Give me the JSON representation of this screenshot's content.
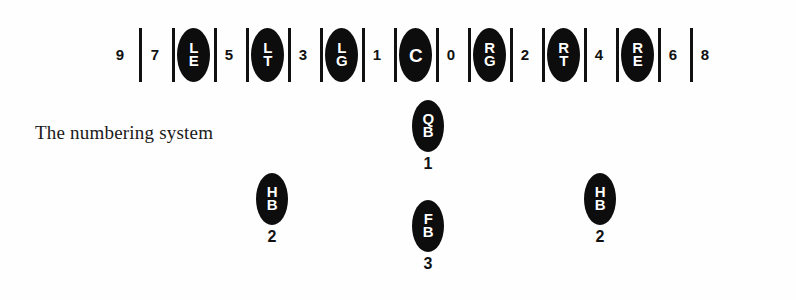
{
  "figure": {
    "caption": "The numbering system",
    "ink_color": "#0d0d0d",
    "paper_color": "#fefefe"
  },
  "line_of_scrimmage": {
    "slots": [
      {
        "kind": "number",
        "label": "9",
        "x": 120
      },
      {
        "kind": "bar",
        "x": 139
      },
      {
        "kind": "number",
        "label": "7",
        "x": 155
      },
      {
        "kind": "bar",
        "x": 172
      },
      {
        "kind": "oval",
        "label": "LE",
        "x": 177
      },
      {
        "kind": "bar",
        "x": 214
      },
      {
        "kind": "number",
        "label": "5",
        "x": 229
      },
      {
        "kind": "bar",
        "x": 246
      },
      {
        "kind": "oval",
        "label": "LT",
        "x": 251
      },
      {
        "kind": "bar",
        "x": 288
      },
      {
        "kind": "number",
        "label": "3",
        "x": 303
      },
      {
        "kind": "bar",
        "x": 320
      },
      {
        "kind": "oval",
        "label": "LG",
        "x": 325
      },
      {
        "kind": "bar",
        "x": 362
      },
      {
        "kind": "number",
        "label": "1",
        "x": 377
      },
      {
        "kind": "bar",
        "x": 394
      },
      {
        "kind": "oval",
        "label": "C",
        "x": 399
      },
      {
        "kind": "bar",
        "x": 436
      },
      {
        "kind": "number",
        "label": "0",
        "x": 451
      },
      {
        "kind": "bar",
        "x": 468
      },
      {
        "kind": "oval",
        "label": "RG",
        "x": 473
      },
      {
        "kind": "bar",
        "x": 510
      },
      {
        "kind": "number",
        "label": "2",
        "x": 525
      },
      {
        "kind": "bar",
        "x": 542
      },
      {
        "kind": "oval",
        "label": "RT",
        "x": 547
      },
      {
        "kind": "bar",
        "x": 584
      },
      {
        "kind": "number",
        "label": "4",
        "x": 599
      },
      {
        "kind": "bar",
        "x": 616
      },
      {
        "kind": "oval",
        "label": "RE",
        "x": 621
      },
      {
        "kind": "bar",
        "x": 658
      },
      {
        "kind": "number",
        "label": "6",
        "x": 673
      },
      {
        "kind": "bar",
        "x": 690
      },
      {
        "kind": "number",
        "label": "8",
        "x": 705
      }
    ]
  },
  "backfield": {
    "players": [
      {
        "position": "QB",
        "number": "1",
        "x": 408,
        "y": 100
      },
      {
        "position": "HB",
        "number": "2",
        "x": 252,
        "y": 173
      },
      {
        "position": "HB",
        "number": "2",
        "x": 580,
        "y": 173
      },
      {
        "position": "FB",
        "number": "3",
        "x": 408,
        "y": 200
      }
    ]
  }
}
